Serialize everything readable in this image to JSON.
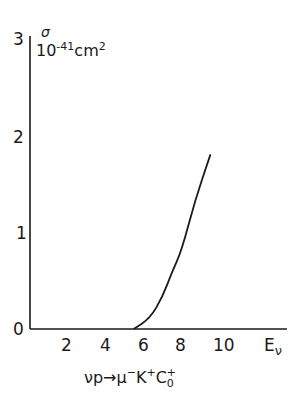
{
  "chart_data": {
    "type": "line",
    "title": "",
    "reaction": "νp → μ⁻K⁺C₀⁺",
    "xlabel": "Eν",
    "ylabel": "σ 10⁻⁴¹ cm²",
    "xlim": [
      0,
      12
    ],
    "ylim": [
      0,
      3
    ],
    "x_ticks": [
      "2",
      "4",
      "6",
      "8",
      "10"
    ],
    "y_ticks": [
      "0",
      "1",
      "2",
      "3"
    ],
    "grid": false,
    "legend": null,
    "series": [
      {
        "name": "σ(νp → μ⁻K⁺C₀⁺)",
        "x": [
          5.4,
          6.25,
          6.9,
          7.4,
          7.9,
          8.6,
          9.4
        ],
        "y": [
          0.0,
          0.11,
          0.33,
          0.59,
          0.81,
          1.33,
          1.8
        ]
      }
    ]
  },
  "labels": {
    "y_symbol": "σ",
    "y_unit_base": "10",
    "y_unit_exp": "-41",
    "y_unit_cm": "cm",
    "y_unit_cm_exp": "2",
    "y_tick_0": "0",
    "y_tick_1": "1",
    "y_tick_2": "2",
    "y_tick_3": "3",
    "x_tick_2": "2",
    "x_tick_4": "4",
    "x_tick_6": "6",
    "x_tick_8": "8",
    "x_tick_10": "10",
    "x_axis_E": "E",
    "x_axis_nu": "ν",
    "reaction_nu_p": "νp",
    "reaction_arrow": "→",
    "reaction_mu": "μ",
    "reaction_mu_charge": "−",
    "reaction_K": "K",
    "reaction_K_charge": "+",
    "reaction_C": "C",
    "reaction_C_charge": "+",
    "reaction_C_sub": "0"
  }
}
